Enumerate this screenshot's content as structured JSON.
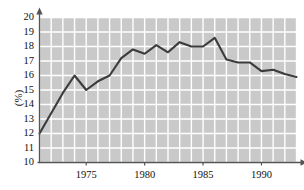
{
  "chart_data": {
    "type": "line",
    "title": "",
    "xlabel": "",
    "ylabel": "(%)",
    "xlim": [
      1971,
      1993
    ],
    "ylim": [
      10,
      20
    ],
    "ytick_labels": [
      "20",
      "19",
      "18",
      "17",
      "16",
      "15",
      "14",
      "13",
      "12",
      "11",
      "10"
    ],
    "yticks": [
      20,
      19,
      18,
      17,
      16,
      15,
      14,
      13,
      12,
      11,
      10
    ],
    "xtick_labels": [
      "1975",
      "1980",
      "1985",
      "1990"
    ],
    "xticks": [
      1975,
      1980,
      1985,
      1990
    ],
    "grid": true,
    "grid_color": "#ffffff",
    "plot_bgcolor": "#c9c9c9",
    "line_color": "#3c3c3c",
    "legend": null,
    "x": [
      1971,
      1972,
      1973,
      1974,
      1975,
      1976,
      1977,
      1978,
      1979,
      1980,
      1981,
      1982,
      1983,
      1984,
      1985,
      1986,
      1987,
      1988,
      1989,
      1990,
      1991,
      1992,
      1993
    ],
    "values": [
      12.0,
      13.4,
      14.8,
      16.0,
      15.0,
      15.6,
      16.0,
      17.2,
      17.8,
      17.5,
      18.1,
      17.6,
      18.3,
      18.0,
      18.0,
      18.6,
      17.1,
      16.9,
      16.9,
      16.3,
      16.4,
      16.1,
      15.9
    ],
    "series": [
      {
        "name": "rate",
        "values": [
          12.0,
          13.4,
          14.8,
          16.0,
          15.0,
          15.6,
          16.0,
          17.2,
          17.8,
          17.5,
          18.1,
          17.6,
          18.3,
          18.0,
          18.0,
          18.6,
          17.1,
          16.9,
          16.9,
          16.3,
          16.4,
          16.1,
          15.9
        ]
      }
    ]
  },
  "axis": {
    "y_unit_label": "(%)"
  }
}
